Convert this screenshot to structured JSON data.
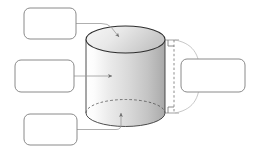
{
  "figure": {
    "title": "",
    "shape_name": "cylinder",
    "style": {
      "background": "#ffffff",
      "outline_color": "#3a3a3a",
      "box_border_color": "#8a8a8a",
      "box_fill": "#ffffff",
      "leader_line_color": "#9a9a9a",
      "dimension_line_color": "#777777",
      "body_fill_light": "#fbfbfb",
      "body_fill_mid": "#dcdcdc",
      "body_fill_dark": "#b6b6b6",
      "top_face_fill_light": "#f2f2f2",
      "top_face_fill_dark": "#c9c9c9"
    }
  },
  "labels": [
    {
      "id": "label-top",
      "name": "top-face-label-box",
      "text": "",
      "placeholder": "",
      "points_to": "top-circular-face"
    },
    {
      "id": "label-middle",
      "name": "lateral-surface-label-box",
      "text": "",
      "placeholder": "",
      "points_to": "curved-lateral-surface"
    },
    {
      "id": "label-bottom",
      "name": "bottom-face-label-box",
      "text": "",
      "placeholder": "",
      "points_to": "bottom-circular-face"
    },
    {
      "id": "label-right",
      "name": "height-label-box",
      "text": "",
      "placeholder": "",
      "points_to": "height-dimension"
    }
  ],
  "annotations": {
    "height_dimension": {
      "name": "height-dimension-line",
      "style": "dashed-with-right-angle-markers",
      "label": ""
    },
    "brace": {
      "name": "curly-brace-connector",
      "label": ""
    }
  }
}
